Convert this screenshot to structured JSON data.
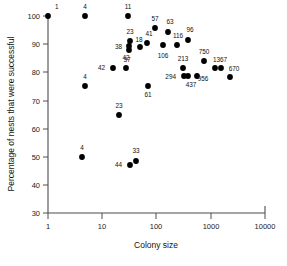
{
  "chart_data": {
    "type": "scatter",
    "title": "",
    "xlabel": "Colony size",
    "ylabel": "Percentage of nests that were successful",
    "xscale": "log",
    "xlim": [
      1,
      10000
    ],
    "ylim": [
      30,
      100
    ],
    "xticks": [
      "1",
      "10",
      "100",
      "1000",
      "10000"
    ],
    "yticks": [
      "30",
      "40",
      "50",
      "60",
      "70",
      "80",
      "90",
      "100"
    ],
    "grid": false,
    "legend": null,
    "point_label_meaning": "colony size (number of nests) printed beside each marker",
    "points": [
      {
        "label": "1",
        "x": 1,
        "y": 100
      },
      {
        "label": "4",
        "x": 5,
        "y": 100
      },
      {
        "label": "11",
        "x": 29,
        "y": 100
      },
      {
        "label": "57",
        "x": 110,
        "y": 96
      },
      {
        "label": "63",
        "x": 135,
        "y": 94.5
      },
      {
        "label": "96",
        "x": 350,
        "y": 91.5
      },
      {
        "label": "23",
        "x": 31,
        "y": 91
      },
      {
        "label": "41",
        "x": 66,
        "y": 90.5
      },
      {
        "label": "116",
        "x": 150,
        "y": 90
      },
      {
        "label": "106",
        "x": 160,
        "y": 89.5
      },
      {
        "label": "38",
        "x": 31,
        "y": 89.5
      },
      {
        "label": "42",
        "x": 31,
        "y": 88
      },
      {
        "label": "18",
        "x": 58,
        "y": 88.5
      },
      {
        "label": "750",
        "x": 760,
        "y": 84
      },
      {
        "label": "213",
        "x": 350,
        "y": 81.5
      },
      {
        "label": "1367",
        "x": 1150,
        "y": 81.8
      },
      {
        "label": "1367b",
        "x": 1450,
        "y": 81.8
      },
      {
        "label": "42",
        "x": 42,
        "y": 81
      },
      {
        "label": "37",
        "x": 66,
        "y": 81
      },
      {
        "label": "294",
        "x": 380,
        "y": 78.3
      },
      {
        "label": "437",
        "x": 440,
        "y": 78.3
      },
      {
        "label": "956",
        "x": 500,
        "y": 78.3
      },
      {
        "label": "670",
        "x": 2300,
        "y": 77.8
      },
      {
        "label": "4",
        "x": 5.5,
        "y": 75
      },
      {
        "label": "61",
        "x": 78,
        "y": 75.3
      },
      {
        "label": "23",
        "x": 26,
        "y": 65
      },
      {
        "label": "4",
        "x": 5,
        "y": 50
      },
      {
        "label": "33",
        "x": 45,
        "y": 48
      },
      {
        "label": "44",
        "x": 40,
        "y": 46
      }
    ]
  },
  "axes": {
    "x_title": "Colony size",
    "y_title": "Percentage of nests that were successful",
    "x_tick_labels": [
      "1",
      "10",
      "100",
      "1000",
      "10000"
    ],
    "y_tick_labels": [
      "100",
      "90",
      "80",
      "70",
      "60",
      "50",
      "40",
      "30"
    ]
  },
  "markers": [
    {
      "name": "1",
      "cx": 48,
      "cy": 16,
      "lx": 55,
      "ly": 9,
      "anchor": "start"
    },
    {
      "name": "4",
      "cx": 85,
      "cy": 16,
      "lx": 85,
      "ly": 9,
      "anchor": "middle"
    },
    {
      "name": "11",
      "cx": 128,
      "cy": 16,
      "lx": 128,
      "ly": 9,
      "anchor": "middle"
    },
    {
      "name": "57",
      "cx": 155,
      "cy": 28,
      "lx": 155,
      "ly": 21,
      "anchor": "middle"
    },
    {
      "name": "63",
      "cx": 168,
      "cy": 32,
      "lx": 170,
      "ly": 24,
      "anchor": "middle"
    },
    {
      "name": "96",
      "cx": 188,
      "cy": 40,
      "lx": 190,
      "ly": 32,
      "anchor": "middle"
    },
    {
      "name": "23",
      "cx": 130,
      "cy": 41,
      "lx": 130,
      "ly": 34,
      "anchor": "middle"
    },
    {
      "name": "41",
      "cx": 147,
      "cy": 43,
      "lx": 149,
      "ly": 36,
      "anchor": "middle"
    },
    {
      "name": "116",
      "cx": 177,
      "cy": 45,
      "lx": 178,
      "ly": 38,
      "anchor": "middle"
    },
    {
      "name": "106",
      "cx": 163,
      "cy": 45,
      "lx": 163,
      "ly": 58,
      "anchor": "middle"
    },
    {
      "name": "38",
      "cx": 129,
      "cy": 46,
      "lx": 122,
      "ly": 49,
      "anchor": "end"
    },
    {
      "name": "42",
      "cx": 129,
      "cy": 50,
      "lx": 126,
      "ly": 60,
      "anchor": "middle"
    },
    {
      "name": "18",
      "cx": 140,
      "cy": 47,
      "lx": 139,
      "ly": 42,
      "anchor": "middle"
    },
    {
      "name": "750",
      "cx": 204,
      "cy": 61,
      "lx": 204,
      "ly": 54,
      "anchor": "middle"
    },
    {
      "name": "213",
      "cx": 183,
      "cy": 68,
      "lx": 183,
      "ly": 61,
      "anchor": "middle"
    },
    {
      "name": "1367",
      "cx": 215,
      "cy": 68,
      "lx": 220,
      "ly": 62,
      "anchor": "middle"
    },
    {
      "name": "1367b",
      "cx": 221,
      "cy": 68,
      "lx": -99,
      "ly": -99,
      "anchor": "middle"
    },
    {
      "name": "42b",
      "cx": 113,
      "cy": 68,
      "lx": 105,
      "ly": 70,
      "anchor": "end"
    },
    {
      "name": "37",
      "cx": 126,
      "cy": 68,
      "lx": 127,
      "ly": 62,
      "anchor": "middle"
    },
    {
      "name": "294",
      "cx": 184,
      "cy": 76,
      "lx": 176,
      "ly": 79,
      "anchor": "end"
    },
    {
      "name": "437",
      "cx": 188,
      "cy": 76,
      "lx": 191,
      "ly": 87,
      "anchor": "middle"
    },
    {
      "name": "956",
      "cx": 197,
      "cy": 76,
      "lx": 203,
      "ly": 81,
      "anchor": "middle"
    },
    {
      "name": "670",
      "cx": 230,
      "cy": 77,
      "lx": 234,
      "ly": 71,
      "anchor": "middle"
    },
    {
      "name": "4b",
      "cx": 85,
      "cy": 86,
      "lx": 85,
      "ly": 79,
      "anchor": "middle"
    },
    {
      "name": "61",
      "cx": 148,
      "cy": 86,
      "lx": 148,
      "ly": 97,
      "anchor": "middle"
    },
    {
      "name": "23b",
      "cx": 119,
      "cy": 115,
      "lx": 119,
      "ly": 108,
      "anchor": "middle"
    },
    {
      "name": "4c",
      "cx": 82,
      "cy": 157,
      "lx": 82,
      "ly": 150,
      "anchor": "middle"
    },
    {
      "name": "33",
      "cx": 136,
      "cy": 161,
      "lx": 136,
      "ly": 153,
      "anchor": "middle"
    },
    {
      "name": "44",
      "cx": 130,
      "cy": 165,
      "lx": 122,
      "ly": 167,
      "anchor": "end"
    }
  ],
  "colors": {
    "marker": "#000000",
    "axis": "#4d4d4d",
    "text": "#111111",
    "background": "#ffffff"
  }
}
